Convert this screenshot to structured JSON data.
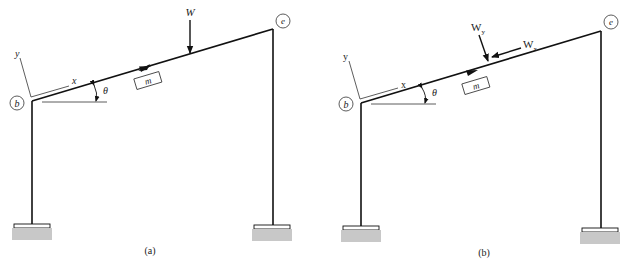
{
  "figure": {
    "colors": {
      "line": "#111111",
      "support_fill": "#c8c8c8",
      "text": "#222222"
    }
  },
  "panels": [
    {
      "caption": "(a)",
      "nodes": {
        "left_corner": "b",
        "right_corner": "e"
      },
      "member_label": "m",
      "axes": {
        "x": "x",
        "y": "y"
      },
      "angle_label": "θ",
      "loads": [
        {
          "label": "W",
          "direction": "vertical-down"
        }
      ]
    },
    {
      "caption": "(b)",
      "nodes": {
        "left_corner": "b",
        "right_corner": "e"
      },
      "member_label": "m",
      "axes": {
        "x": "x",
        "y": "y"
      },
      "angle_label": "θ",
      "loads": [
        {
          "label": "W",
          "subscript": "y",
          "direction": "perpendicular-to-member"
        },
        {
          "label": "W",
          "subscript": "x",
          "direction": "along-member-toward-b"
        }
      ]
    }
  ]
}
